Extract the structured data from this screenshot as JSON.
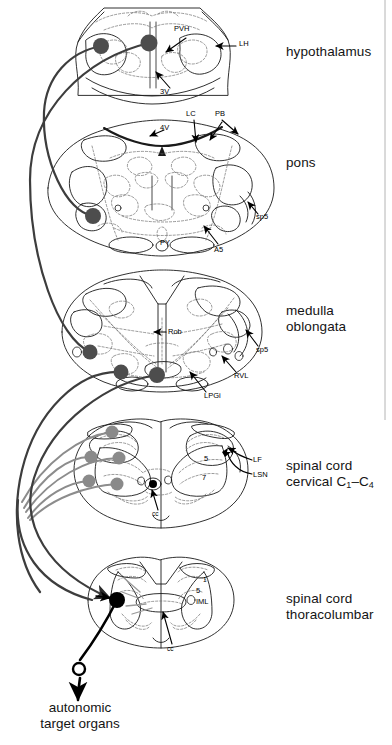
{
  "figure": {
    "background": "#ffffff",
    "frame_color": "#b4b4b4"
  },
  "palette": {
    "outline": "#1a1a1a",
    "interior_dashed": "#6e6e6e",
    "tract_dark": "#3d3d3d",
    "tract_gray": "#8c8c8c",
    "node_dark": "#4d4d4d",
    "node_gray": "#8a8a8a",
    "node_black": "#000000",
    "text": "#141414"
  },
  "regions": [
    {
      "id": "hypothalamus",
      "label": "hypothalamus",
      "label_x": 286,
      "label_y": 44,
      "center_x": 152,
      "center_y": 55
    },
    {
      "id": "pons",
      "label": "pons",
      "label_x": 286,
      "label_y": 155,
      "center_x": 160,
      "center_y": 185
    },
    {
      "id": "medulla-oblongata",
      "label": "medulla\noblongata",
      "label_x": 286,
      "label_y": 303,
      "center_x": 160,
      "center_y": 330
    },
    {
      "id": "spinal-cord-cervical",
      "label": "spinal cord\ncervical C",
      "label_suffix_1": "1",
      "label_dash": "–",
      "label_suffix_2": "C",
      "label_suffix_3": "4",
      "label_x": 286,
      "label_y": 458,
      "center_x": 160,
      "center_y": 478
    },
    {
      "id": "spinal-cord-thoracolumbar",
      "label": "spinal cord\nthoracolumbar",
      "label_x": 286,
      "label_y": 591,
      "center_x": 160,
      "center_y": 605
    }
  ],
  "terminal": {
    "label": "autonomic\ntarget organs",
    "x": 42,
    "y": 676,
    "synapse_symbol": "open-circle"
  },
  "annotations": [
    {
      "id": "PVH",
      "text": "PVH",
      "x": 174,
      "y": 30,
      "size": "sm",
      "region": "hypothalamus"
    },
    {
      "id": "LH",
      "text": "LH",
      "x": 239,
      "y": 42,
      "size": "sm",
      "region": "hypothalamus"
    },
    {
      "id": "3V",
      "text": "3V",
      "x": 160,
      "y": 90,
      "size": "sm",
      "region": "hypothalamus"
    },
    {
      "id": "4V",
      "text": "4V",
      "x": 157,
      "y": 126,
      "size": "sm",
      "region": "pons"
    },
    {
      "id": "LC",
      "text": "LC",
      "x": 188,
      "y": 113,
      "size": "sm",
      "region": "pons"
    },
    {
      "id": "PB",
      "text": "PB",
      "x": 216,
      "y": 113,
      "size": "sm",
      "region": "pons"
    },
    {
      "id": "sp5-pons",
      "text": "sp5",
      "x": 258,
      "y": 215,
      "size": "sm",
      "region": "pons"
    },
    {
      "id": "PY",
      "text": "PY",
      "x": 162,
      "y": 241,
      "size": "sm",
      "region": "pons"
    },
    {
      "id": "A5",
      "text": "A5",
      "x": 216,
      "y": 248,
      "size": "sm",
      "region": "pons"
    },
    {
      "id": "Rob",
      "text": "Rob",
      "x": 167,
      "y": 334,
      "size": "sm",
      "region": "medulla-oblongata"
    },
    {
      "id": "sp5-medulla",
      "text": "sp5",
      "x": 257,
      "y": 349,
      "size": "sm",
      "region": "medulla-oblongata"
    },
    {
      "id": "RVL",
      "text": "RVL",
      "x": 234,
      "y": 376,
      "size": "sm",
      "region": "medulla-oblongata"
    },
    {
      "id": "LPGi",
      "text": "LPGi",
      "x": 206,
      "y": 396,
      "size": "sm",
      "region": "medulla-oblongata"
    },
    {
      "id": "LF",
      "text": "LF",
      "x": 254,
      "y": 461,
      "size": "sm",
      "region": "spinal-cord-cervical"
    },
    {
      "id": "LSN",
      "text": "LSN",
      "x": 254,
      "y": 477,
      "size": "sm",
      "region": "spinal-cord-cervical"
    },
    {
      "id": "cerv-5",
      "text": "5",
      "x": 205,
      "y": 460,
      "size": "sm",
      "region": "spinal-cord-cervical"
    },
    {
      "id": "cerv-7",
      "text": "7",
      "x": 203,
      "y": 479,
      "size": "sm",
      "region": "spinal-cord-cervical"
    },
    {
      "id": "cerv-cc",
      "text": "cc",
      "x": 154,
      "y": 513,
      "size": "xs",
      "region": "spinal-cord-cervical"
    },
    {
      "id": "thor-1",
      "text": "1",
      "x": 204,
      "y": 580,
      "size": "xs",
      "region": "spinal-cord-thoracolumbar"
    },
    {
      "id": "thor-5",
      "text": "5",
      "x": 198,
      "y": 592,
      "size": "sm",
      "region": "spinal-cord-thoracolumbar"
    },
    {
      "id": "IML",
      "text": "IML",
      "x": 199,
      "y": 603,
      "size": "sm",
      "region": "spinal-cord-thoracolumbar"
    },
    {
      "id": "thor-cc",
      "text": "cc",
      "x": 169,
      "y": 648,
      "size": "xs",
      "region": "spinal-cord-thoracolumbar"
    }
  ],
  "nodes": [
    {
      "id": "hyp-left",
      "x": 101,
      "y": 46,
      "r": 8.0,
      "color": "#4d4d4d",
      "region": "hypothalamus"
    },
    {
      "id": "hyp-right",
      "x": 149,
      "y": 43,
      "r": 8.5,
      "color": "#4d4d4d",
      "region": "hypothalamus"
    },
    {
      "id": "pons-a5",
      "x": 93,
      "y": 216,
      "r": 8.0,
      "color": "#4d4d4d",
      "region": "pons"
    },
    {
      "id": "med-rvl",
      "x": 90,
      "y": 352,
      "r": 7.5,
      "color": "#4d4d4d",
      "region": "medulla-oblongata"
    },
    {
      "id": "med-lpgi",
      "x": 121,
      "y": 372,
      "r": 7.5,
      "color": "#4d4d4d",
      "region": "medulla-oblongata"
    },
    {
      "id": "med-rob",
      "x": 157,
      "y": 375,
      "r": 8.0,
      "color": "#4d4d4d",
      "region": "medulla-oblongata"
    },
    {
      "id": "cerv-dorsal",
      "x": 112,
      "y": 432,
      "r": 6.5,
      "color": "#8a8a8a",
      "region": "spinal-cord-cervical"
    },
    {
      "id": "cerv-lsn-1",
      "x": 91,
      "y": 457,
      "r": 6.5,
      "color": "#8a8a8a",
      "region": "spinal-cord-cervical"
    },
    {
      "id": "cerv-lsn-2",
      "x": 119,
      "y": 458,
      "r": 6.5,
      "color": "#8a8a8a",
      "region": "spinal-cord-cervical"
    },
    {
      "id": "cerv-vent-1",
      "x": 89,
      "y": 481,
      "r": 6.5,
      "color": "#8a8a8a",
      "region": "spinal-cord-cervical"
    },
    {
      "id": "cerv-vent-2",
      "x": 117,
      "y": 484,
      "r": 6.5,
      "color": "#8a8a8a",
      "region": "spinal-cord-cervical"
    },
    {
      "id": "cerv-cc-dot",
      "x": 153,
      "y": 484,
      "r": 4.0,
      "color": "#000000",
      "region": "spinal-cord-cervical"
    },
    {
      "id": "thor-iml",
      "x": 117,
      "y": 600,
      "r": 8.0,
      "color": "#000000",
      "region": "spinal-cord-thoracolumbar"
    }
  ],
  "tracts": [
    {
      "id": "tract-pons-to-hyp",
      "color": "#3d3d3d",
      "width": 2.2
    },
    {
      "id": "tract-medulla-to-hyp",
      "color": "#3d3d3d",
      "width": 2.2
    },
    {
      "id": "tract-cervical-a",
      "color": "#8c8c8c",
      "width": 2.0
    },
    {
      "id": "tract-cervical-b",
      "color": "#8c8c8c",
      "width": 2.0
    },
    {
      "id": "tract-cervical-c",
      "color": "#8c8c8c",
      "width": 2.0
    },
    {
      "id": "tract-descending-long",
      "color": "#3d3d3d",
      "width": 2.2
    },
    {
      "id": "tract-to-thoracolumbar",
      "color": "#3d3d3d",
      "width": 2.2
    },
    {
      "id": "tract-to-target-organs",
      "color": "#000000",
      "width": 2.6
    }
  ]
}
